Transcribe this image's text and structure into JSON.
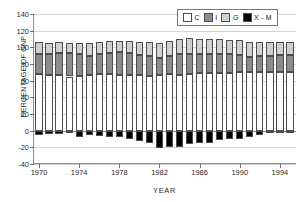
{
  "chart_data": {
    "type": "bar",
    "subtype": "stacked-bar-with-negative",
    "title": "",
    "xlabel": "YEAR",
    "ylabel": "PERCENTAGE OF GNP",
    "ylim": [
      -40,
      140
    ],
    "yticks": [
      -40,
      -20,
      0,
      20,
      40,
      60,
      80,
      100,
      120,
      140
    ],
    "xticks": [
      1970,
      1974,
      1978,
      1982,
      1986,
      1990,
      1994
    ],
    "xlim": [
      1969.4,
      1995.6
    ],
    "grid": true,
    "grid_axis": "y",
    "legend": [
      "C",
      "I",
      "G",
      "X - M"
    ],
    "legend_position": "top-right",
    "categories": [
      1970,
      1971,
      1972,
      1973,
      1974,
      1975,
      1976,
      1977,
      1978,
      1979,
      1980,
      1981,
      1982,
      1983,
      1984,
      1985,
      1986,
      1987,
      1988,
      1989,
      1990,
      1991,
      1992,
      1993,
      1994,
      1995
    ],
    "series": [
      {
        "name": "C",
        "label": "C",
        "color": "#ffffff",
        "values": [
          67.5,
          67.0,
          67.0,
          65.0,
          65.5,
          67.0,
          67.5,
          67.5,
          67.0,
          67.0,
          67.0,
          65.5,
          67.0,
          68.0,
          67.0,
          68.5,
          69.0,
          69.5,
          69.5,
          69.5,
          70.0,
          70.0,
          70.5,
          70.5,
          70.0,
          70.0
        ]
      },
      {
        "name": "I",
        "label": "I",
        "color": "#8c8c8c",
        "values": [
          25.0,
          25.5,
          26.5,
          28.0,
          26.0,
          22.5,
          24.0,
          26.0,
          27.0,
          26.5,
          23.5,
          24.5,
          20.5,
          21.5,
          25.5,
          24.0,
          23.0,
          23.0,
          22.5,
          22.0,
          20.5,
          18.5,
          19.0,
          19.5,
          21.0,
          21.0
        ]
      },
      {
        "name": "G",
        "label": "G",
        "color": "#d0d0d0",
        "values": [
          14.0,
          13.0,
          12.5,
          12.0,
          14.0,
          15.5,
          15.0,
          14.5,
          14.0,
          14.0,
          16.0,
          16.5,
          18.0,
          18.0,
          17.5,
          18.5,
          18.5,
          18.0,
          17.5,
          17.5,
          18.0,
          18.0,
          17.5,
          16.5,
          15.5,
          15.0
        ]
      },
      {
        "name": "X - M",
        "label": "X - M",
        "color": "#000000",
        "values": [
          -5.0,
          -4.0,
          -4.5,
          -3.0,
          -7.5,
          -5.0,
          -7.0,
          -8.0,
          -8.0,
          -10.0,
          -13.0,
          -14.5,
          -20.5,
          -19.5,
          -19.5,
          -16.0,
          -14.5,
          -14.5,
          -11.0,
          -9.5,
          -9.5,
          -7.5,
          -5.5,
          -3.0,
          -0.5,
          -1.0
        ]
      }
    ]
  }
}
